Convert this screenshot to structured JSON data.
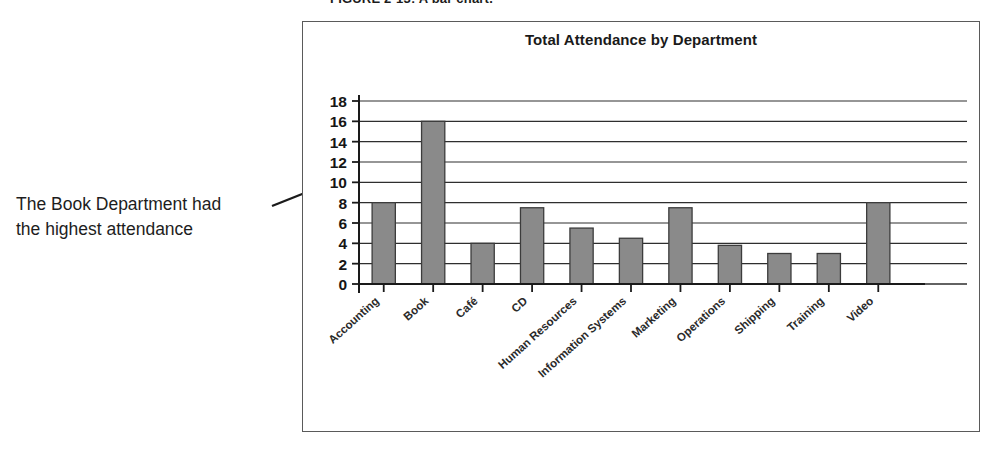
{
  "figure": {
    "caption": "FIGURE 2-13:  A bar chart."
  },
  "annotation": {
    "line1": "The Book Department had",
    "line2": "the highest attendance",
    "leader_color": "#1b1b1b"
  },
  "chart_data": {
    "type": "bar",
    "title": "Total Attendance by Department",
    "xlabel": "",
    "ylabel": "",
    "categories": [
      "Accounting",
      "Book",
      "Café",
      "CD",
      "Human Resources",
      "Information Systems",
      "Marketing",
      "Operations",
      "Shipping",
      "Training",
      "Video"
    ],
    "values": [
      8,
      16,
      4,
      7.5,
      5.5,
      4.5,
      7.5,
      3.8,
      3,
      3,
      8
    ],
    "ylim": [
      0,
      18
    ],
    "ytick_labels": [
      "0",
      "2",
      "4",
      "6",
      "8",
      "10",
      "12",
      "14",
      "16",
      "18"
    ],
    "ytick_values": [
      0,
      2,
      4,
      6,
      8,
      10,
      12,
      14,
      16,
      18
    ],
    "grid": true,
    "legend": false,
    "bar_fill": "#8a8a8a",
    "bar_stroke": "#3c3c3c",
    "axis_color": "#1a1a1a",
    "grid_color": "#2e2e2e"
  }
}
